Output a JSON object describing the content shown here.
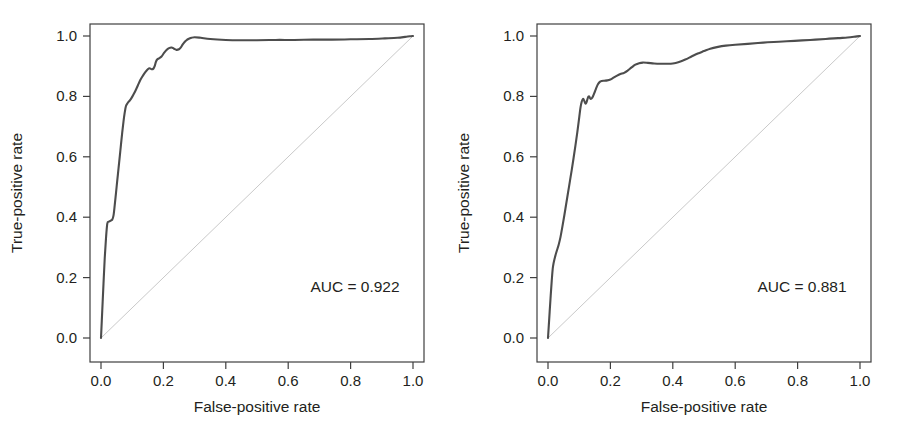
{
  "figure": {
    "background": "#ffffff",
    "panel_count": 2
  },
  "style": {
    "curve_color": "#4d4d4d",
    "curve_width": 2.1,
    "diagonal_color": "#c9c9c9",
    "diagonal_width": 1.0,
    "axis_color": "#3f3f3f",
    "text_color": "#231f20"
  },
  "chart_data": [
    {
      "type": "line",
      "panel": "left",
      "title": "",
      "xlabel": "False-positive rate",
      "ylabel": "True-positive rate",
      "xlim": [
        0.0,
        1.0
      ],
      "ylim": [
        0.0,
        1.0
      ],
      "grid": false,
      "legend": "none",
      "annotations": [
        {
          "name": "auc",
          "text": "AUC = 0.922",
          "x": 0.6,
          "y": 0.21
        }
      ],
      "xticks": [
        0.0,
        0.2,
        0.4,
        0.6,
        0.8,
        1.0
      ],
      "yticks": [
        0.0,
        0.2,
        0.4,
        0.6,
        0.8,
        1.0
      ],
      "xticklabels": [
        "0.0",
        "0.2",
        "0.4",
        "0.6",
        "0.8",
        "1.0"
      ],
      "yticklabels": [
        "0.0",
        "0.2",
        "0.4",
        "0.6",
        "0.8",
        "1.0"
      ],
      "series": [
        {
          "name": "roc-curve",
          "auc": 0.922,
          "x": [
            0.0,
            0.004,
            0.008,
            0.012,
            0.016,
            0.02,
            0.024,
            0.03,
            0.036,
            0.04,
            0.044,
            0.048,
            0.052,
            0.056,
            0.06,
            0.064,
            0.068,
            0.072,
            0.076,
            0.08,
            0.086,
            0.092,
            0.098,
            0.104,
            0.11,
            0.118,
            0.126,
            0.134,
            0.142,
            0.15,
            0.156,
            0.162,
            0.168,
            0.172,
            0.176,
            0.18,
            0.186,
            0.194,
            0.202,
            0.21,
            0.218,
            0.226,
            0.234,
            0.242,
            0.25,
            0.256,
            0.262,
            0.268,
            0.274,
            0.28,
            0.29,
            0.3,
            0.32,
            0.35,
            0.4,
            0.45,
            0.5,
            0.56,
            0.62,
            0.68,
            0.74,
            0.8,
            0.86,
            0.91,
            0.95,
            0.975,
            0.99,
            1.0
          ],
          "y": [
            0.0,
            0.09,
            0.18,
            0.265,
            0.33,
            0.378,
            0.385,
            0.388,
            0.392,
            0.405,
            0.44,
            0.48,
            0.52,
            0.56,
            0.6,
            0.64,
            0.68,
            0.716,
            0.746,
            0.768,
            0.779,
            0.786,
            0.795,
            0.806,
            0.818,
            0.836,
            0.854,
            0.868,
            0.88,
            0.89,
            0.893,
            0.89,
            0.892,
            0.9,
            0.914,
            0.922,
            0.926,
            0.932,
            0.944,
            0.954,
            0.96,
            0.962,
            0.958,
            0.954,
            0.956,
            0.962,
            0.972,
            0.98,
            0.986,
            0.99,
            0.994,
            0.996,
            0.994,
            0.99,
            0.987,
            0.986,
            0.986,
            0.987,
            0.987,
            0.988,
            0.988,
            0.989,
            0.99,
            0.992,
            0.994,
            0.997,
            0.999,
            1.0
          ]
        },
        {
          "name": "reference-diagonal",
          "x": [
            0.0,
            1.0
          ],
          "y": [
            0.0,
            1.0
          ]
        }
      ]
    },
    {
      "type": "line",
      "panel": "right",
      "title": "",
      "xlabel": "False-positive rate",
      "ylabel": "True-positive rate",
      "xlim": [
        0.0,
        1.0
      ],
      "ylim": [
        0.0,
        1.0
      ],
      "grid": false,
      "legend": "none",
      "annotations": [
        {
          "name": "auc",
          "text": "AUC = 0.881",
          "x": 0.6,
          "y": 0.21
        }
      ],
      "xticks": [
        0.0,
        0.2,
        0.4,
        0.6,
        0.8,
        1.0
      ],
      "yticks": [
        0.0,
        0.2,
        0.4,
        0.6,
        0.8,
        1.0
      ],
      "xticklabels": [
        "0.0",
        "0.2",
        "0.4",
        "0.6",
        "0.8",
        "1.0"
      ],
      "yticklabels": [
        "0.0",
        "0.2",
        "0.4",
        "0.6",
        "0.8",
        "1.0"
      ],
      "series": [
        {
          "name": "roc-curve",
          "auc": 0.881,
          "x": [
            0.0,
            0.004,
            0.008,
            0.012,
            0.016,
            0.022,
            0.028,
            0.034,
            0.04,
            0.046,
            0.052,
            0.058,
            0.064,
            0.07,
            0.076,
            0.082,
            0.088,
            0.094,
            0.1,
            0.104,
            0.108,
            0.112,
            0.116,
            0.12,
            0.124,
            0.128,
            0.132,
            0.136,
            0.142,
            0.148,
            0.154,
            0.16,
            0.166,
            0.172,
            0.18,
            0.19,
            0.2,
            0.21,
            0.22,
            0.232,
            0.244,
            0.256,
            0.268,
            0.28,
            0.292,
            0.304,
            0.32,
            0.34,
            0.36,
            0.38,
            0.4,
            0.42,
            0.44,
            0.46,
            0.48,
            0.5,
            0.52,
            0.545,
            0.57,
            0.6,
            0.64,
            0.69,
            0.74,
            0.79,
            0.84,
            0.89,
            0.93,
            0.96,
            0.985,
            1.0
          ],
          "y": [
            0.0,
            0.065,
            0.13,
            0.19,
            0.236,
            0.266,
            0.288,
            0.308,
            0.334,
            0.368,
            0.404,
            0.442,
            0.48,
            0.518,
            0.556,
            0.596,
            0.638,
            0.682,
            0.73,
            0.762,
            0.782,
            0.792,
            0.786,
            0.776,
            0.782,
            0.796,
            0.8,
            0.792,
            0.796,
            0.81,
            0.826,
            0.84,
            0.848,
            0.851,
            0.852,
            0.853,
            0.856,
            0.862,
            0.868,
            0.874,
            0.878,
            0.886,
            0.896,
            0.905,
            0.91,
            0.912,
            0.911,
            0.909,
            0.908,
            0.908,
            0.909,
            0.914,
            0.922,
            0.932,
            0.942,
            0.95,
            0.958,
            0.964,
            0.968,
            0.971,
            0.974,
            0.978,
            0.981,
            0.984,
            0.987,
            0.99,
            0.993,
            0.995,
            0.998,
            1.0
          ]
        },
        {
          "name": "reference-diagonal",
          "x": [
            0.0,
            1.0
          ],
          "y": [
            0.0,
            1.0
          ]
        }
      ]
    }
  ]
}
